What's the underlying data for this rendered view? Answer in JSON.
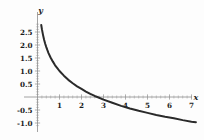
{
  "chart_data": {
    "type": "line",
    "title": "",
    "subtitle": "",
    "xlabel": "x",
    "ylabel": "y",
    "function": "y = 1 - ln(x)",
    "xlim": [
      0,
      7.4
    ],
    "ylim": [
      -1.15,
      2.85
    ],
    "grid": false,
    "legend": null,
    "legend_position": "none",
    "x_ticks": [
      1,
      2,
      3,
      4,
      5,
      6,
      7
    ],
    "x_tick_labels": [
      "1",
      "2",
      "3",
      "4",
      "5",
      "6",
      "7"
    ],
    "y_ticks": [
      2.5,
      2.0,
      1.5,
      1.0,
      0.5,
      -0.5,
      -1.0
    ],
    "y_tick_labels": [
      "2.5",
      "2.0",
      "1.5",
      "1.0",
      "0.5",
      "-0.5",
      "-1.0"
    ],
    "x_minor_step": 0.2,
    "y_minor_step": 0.1,
    "x_axis_position_y": 0,
    "y_axis_position_x": 0,
    "series": [
      {
        "name": "curve",
        "color": "#2a2a2a",
        "x": [
          0.17,
          0.2,
          0.25,
          0.3,
          0.35,
          0.4,
          0.45,
          0.5,
          0.6,
          0.7,
          0.8,
          0.9,
          1.0,
          1.2,
          1.4,
          1.6,
          1.8,
          2.0,
          2.2,
          2.4,
          2.6,
          2.718,
          3.0,
          3.4,
          3.8,
          4.2,
          4.6,
          5.0,
          5.4,
          5.8,
          6.2,
          6.6,
          7.0,
          7.2
        ],
        "y": [
          2.77,
          2.61,
          2.39,
          2.2,
          2.05,
          1.92,
          1.8,
          1.69,
          1.51,
          1.36,
          1.22,
          1.11,
          1.0,
          0.82,
          0.66,
          0.53,
          0.41,
          0.31,
          0.21,
          0.12,
          0.04,
          0.0,
          -0.1,
          -0.22,
          -0.34,
          -0.44,
          -0.53,
          -0.61,
          -0.69,
          -0.76,
          -0.82,
          -0.89,
          -0.95,
          -0.97
        ]
      }
    ],
    "x_intercept": 2.718
  },
  "axes": {
    "x_name": "x",
    "y_name": "y"
  }
}
